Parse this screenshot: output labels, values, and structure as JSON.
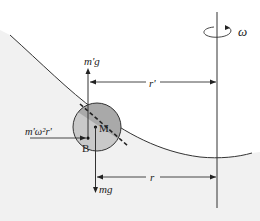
{
  "figure": {
    "colors": {
      "background": "#ffffff",
      "liquid": "#f1f1f1",
      "sphere_submerged": "#c9c9c9",
      "sphere_above": "#a9a9a9",
      "line": "#333333"
    },
    "labels": {
      "omega": "ω",
      "m_prime_g": "m'g",
      "r_prime": "r'",
      "centrifugal": "m'ω²r'",
      "M": "M",
      "B": "B",
      "mg": "mg",
      "r": "r"
    }
  }
}
